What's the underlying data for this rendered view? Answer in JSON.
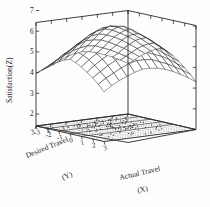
{
  "figure": {
    "type": "3d-surface-plot",
    "background": "#ffffff",
    "line_color": "#1c1c1c"
  },
  "chart_data": {
    "type": "surface",
    "title": "",
    "xlabel": "Actual Travel",
    "xlabel_var": "(X)",
    "ylabel": "Desired Travel",
    "ylabel_var": "(Y)",
    "zlabel": "Satisfaction(Z)",
    "xticks": [
      "-3",
      "-2",
      "-1",
      "0",
      "1",
      "2",
      "3"
    ],
    "yticks": [
      "3",
      "2",
      "1",
      "0",
      "-1",
      "-2",
      "-3"
    ],
    "zticks": [
      "7",
      "6",
      "5",
      "4",
      "3",
      "2"
    ],
    "xlim": [
      -3,
      3
    ],
    "ylim": [
      -3,
      3
    ],
    "zlim": [
      2,
      7
    ],
    "grid": true,
    "legend": "none",
    "surface_description": "Ridge / tent-shaped response surface peaking along the line where Actual Travel equals Desired Travel",
    "surface_peak_z": 6.9,
    "surface_edge_z_left": 4.6,
    "surface_edge_z_right": 4.3,
    "mesh_rows": 13,
    "mesh_cols": 13,
    "x": [
      -3,
      -2.5,
      -2,
      -1.5,
      -1,
      -0.5,
      0,
      0.5,
      1,
      1.5,
      2,
      2.5,
      3
    ],
    "y": [
      3,
      2.5,
      2,
      1.5,
      1,
      0.5,
      0,
      -0.5,
      -1,
      -1.5,
      -2,
      -2.5,
      -3
    ],
    "z_rows": [
      [
        4.55,
        4.75,
        4.95,
        5.15,
        5.35,
        5.5,
        5.6,
        5.5,
        5.35,
        5.15,
        4.95,
        4.7,
        4.4
      ],
      [
        4.7,
        4.95,
        5.2,
        5.45,
        5.65,
        5.8,
        5.9,
        5.8,
        5.65,
        5.45,
        5.2,
        4.95,
        4.65
      ],
      [
        4.85,
        5.15,
        5.45,
        5.7,
        5.95,
        6.1,
        6.2,
        6.1,
        5.9,
        5.7,
        5.45,
        5.15,
        4.85
      ],
      [
        5.0,
        5.35,
        5.65,
        5.95,
        6.2,
        6.4,
        6.5,
        6.35,
        6.15,
        5.9,
        5.65,
        5.35,
        5.0
      ],
      [
        5.15,
        5.5,
        5.85,
        6.15,
        6.45,
        6.65,
        6.75,
        6.6,
        6.35,
        6.1,
        5.8,
        5.5,
        5.15
      ],
      [
        5.25,
        5.6,
        6.0,
        6.3,
        6.6,
        6.8,
        6.9,
        6.75,
        6.5,
        6.2,
        5.9,
        5.6,
        5.25
      ],
      [
        5.3,
        5.65,
        6.0,
        6.35,
        6.65,
        6.85,
        6.9,
        6.8,
        6.55,
        6.25,
        5.95,
        5.6,
        5.25
      ],
      [
        5.25,
        5.6,
        5.95,
        6.25,
        6.55,
        6.75,
        6.85,
        6.7,
        6.45,
        6.15,
        5.85,
        5.55,
        5.2
      ],
      [
        5.15,
        5.45,
        5.8,
        6.1,
        6.35,
        6.55,
        6.65,
        6.5,
        6.3,
        6.0,
        5.7,
        5.4,
        5.1
      ],
      [
        5.0,
        5.3,
        5.6,
        5.9,
        6.15,
        6.3,
        6.4,
        6.3,
        6.1,
        5.85,
        5.55,
        5.25,
        4.95
      ],
      [
        4.85,
        5.1,
        5.4,
        5.65,
        5.9,
        6.05,
        6.15,
        6.05,
        5.85,
        5.6,
        5.35,
        5.05,
        4.75
      ],
      [
        4.65,
        4.9,
        5.15,
        5.4,
        5.6,
        5.75,
        5.85,
        5.75,
        5.6,
        5.35,
        5.1,
        4.85,
        4.55
      ],
      [
        4.45,
        4.65,
        4.9,
        5.1,
        5.3,
        5.45,
        5.55,
        5.45,
        5.3,
        5.1,
        4.85,
        4.6,
        4.3
      ]
    ],
    "scatter_note": "Scattered observation points projected on the base plane (Z floor)",
    "scatter_count": 120
  }
}
